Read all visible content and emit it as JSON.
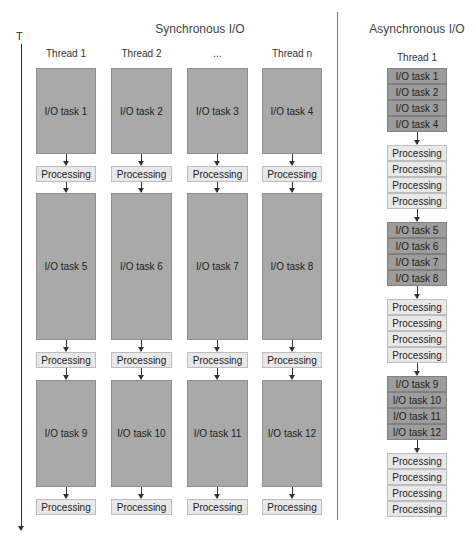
{
  "axis": {
    "label": "T"
  },
  "sync": {
    "title": "Synchronous I/O",
    "threads": [
      "Thread 1",
      "Thread 2",
      "...",
      "Thread n"
    ],
    "rounds": [
      {
        "io": [
          "I/O task 1",
          "I/O task 2",
          "I/O task 3",
          "I/O task 4"
        ]
      },
      {
        "io": [
          "I/O task 5",
          "I/O task 6",
          "I/O task 7",
          "I/O task 8"
        ]
      },
      {
        "io": [
          "I/O task 9",
          "I/O task 10",
          "I/O task 11",
          "I/O task 12"
        ]
      }
    ],
    "processing_label": "Processing"
  },
  "async": {
    "title": "Asynchronous I/O",
    "thread": "Thread 1",
    "groups": [
      {
        "type": "io",
        "items": [
          "I/O task 1",
          "I/O task 2",
          "I/O task 3",
          "I/O task 4"
        ]
      },
      {
        "type": "processing",
        "items": [
          "Processing",
          "Processing",
          "Processing",
          "Processing"
        ]
      },
      {
        "type": "io",
        "items": [
          "I/O task 5",
          "I/O task 6",
          "I/O task 7",
          "I/O task 8"
        ]
      },
      {
        "type": "processing",
        "items": [
          "Processing",
          "Processing",
          "Processing",
          "Processing"
        ]
      },
      {
        "type": "io",
        "items": [
          "I/O task 9",
          "I/O task 10",
          "I/O task 11",
          "I/O task 12"
        ]
      },
      {
        "type": "processing",
        "items": [
          "Processing",
          "Processing",
          "Processing",
          "Processing"
        ]
      }
    ]
  },
  "colors": {
    "io_sync": "#a9a9a9",
    "io_async": "#9c9c9c",
    "processing": "#e8e8e8",
    "border": "#bdbdbd"
  }
}
